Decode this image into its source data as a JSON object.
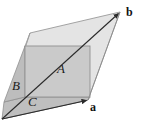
{
  "figure": {
    "type": "geometry-diagram",
    "width": 142,
    "height": 134,
    "background_color": "#ffffff",
    "regions": [
      {
        "id": "parallelogram",
        "name": "parallelogram-ab",
        "label": "",
        "fill_color": "#e3e3e3",
        "stroke_color": "#8c8c8c",
        "points": "30,33 120,12 88,100 2,119"
      },
      {
        "id": "region-A",
        "name": "rectangle-A",
        "label": "A",
        "fill_color": "#c9c9c9",
        "stroke_color": "#8f8f8f",
        "points": "25,46 90,46 90,97 25,97"
      },
      {
        "id": "region-B",
        "name": "triangle-B",
        "label": "B",
        "fill_color": "#bdbdbd",
        "stroke_color": "#909090",
        "points": "25,46 25,97 4,102"
      },
      {
        "id": "region-C",
        "name": "triangle-C",
        "label": "C",
        "fill_color": "#bcbcbc",
        "stroke_color": "#8f8f8f",
        "points": "4,102 25,97 90,97 88,100 2,119"
      }
    ],
    "vectors": [
      {
        "id": "vector-a",
        "name": "vector-a",
        "label": "a",
        "from": "2,119",
        "to": "88,100",
        "color": "#333333",
        "arrowhead": true
      },
      {
        "id": "vector-b",
        "name": "vector-b",
        "label": "b",
        "from": "2,119",
        "to": "120,12",
        "color": "#333333",
        "arrowhead": true
      }
    ],
    "labels": {
      "A": "A",
      "B": "B",
      "C": "C",
      "a": "a",
      "b": "b"
    }
  }
}
